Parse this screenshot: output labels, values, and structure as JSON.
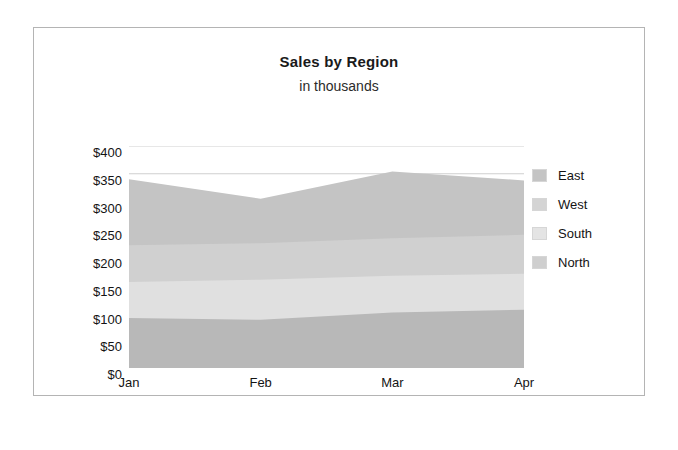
{
  "chart_data": {
    "type": "area",
    "stacked": true,
    "title": "Sales by Region",
    "subtitle": "in thousands",
    "xlabel": "",
    "ylabel": "",
    "categories": [
      "Jan",
      "Feb",
      "Mar",
      "Apr"
    ],
    "ylim": [
      0,
      400
    ],
    "yticks": [
      0,
      50,
      100,
      150,
      200,
      250,
      300,
      350,
      400
    ],
    "ytick_labels": [
      "$0",
      "$50",
      "$100",
      "$150",
      "$200",
      "$250",
      "$300",
      "$350",
      "$400"
    ],
    "grid": true,
    "legend_position": "right",
    "series": [
      {
        "name": "North",
        "values": [
          90,
          87,
          100,
          105
        ],
        "color": "#b8b8b8"
      },
      {
        "name": "South",
        "values": [
          65,
          72,
          66,
          65
        ],
        "color": "#e0e0e0"
      },
      {
        "name": "West",
        "values": [
          66,
          66,
          68,
          70
        ],
        "color": "#d0d0d0"
      },
      {
        "name": "East",
        "values": [
          119,
          80,
          120,
          98
        ],
        "color": "#c4c4c4"
      }
    ],
    "legend_order": [
      "East",
      "West",
      "South",
      "North"
    ],
    "cumulative_tops": {
      "North": [
        90,
        87,
        100,
        105
      ],
      "South": [
        155,
        159,
        166,
        170
      ],
      "West": [
        221,
        225,
        234,
        240
      ],
      "East": [
        340,
        305,
        354,
        338
      ]
    }
  },
  "legend": {
    "items": [
      {
        "label": "East",
        "color": "#c4c4c4"
      },
      {
        "label": "West",
        "color": "#d4d4d4"
      },
      {
        "label": "South",
        "color": "#e4e4e4"
      },
      {
        "label": "North",
        "color": "#cfcfcf"
      }
    ]
  },
  "colors": {
    "frame_border": "#b4b4b4",
    "background": "#ffffff",
    "gridline": "#cfcfcf",
    "axis_text": "#141414",
    "title_text": "#1a1a1a"
  }
}
